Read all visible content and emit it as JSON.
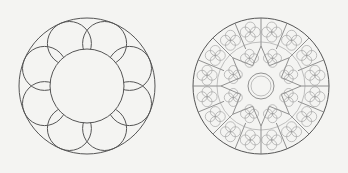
{
  "figures": [
    {
      "name": "simple-rose-window",
      "petal_count": 8,
      "stroke": "#555555"
    },
    {
      "name": "ornate-rose-window",
      "radial_divisions": 16,
      "foil_ring_count": 8,
      "stroke": "#666666"
    }
  ],
  "background": "#f4f4f2"
}
